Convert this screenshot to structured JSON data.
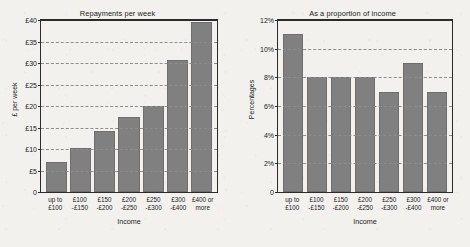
{
  "chart_data": [
    {
      "type": "bar",
      "title": "Repayments per week",
      "xlabel": "Income",
      "ylabel": "£ per week",
      "categories": [
        "up to £100",
        "£100 -£150",
        "£150 -£200",
        "£200 -£250",
        "£250 -£300",
        "£300 -£400",
        "£400 or more"
      ],
      "category_lines": [
        [
          "up to",
          "£100"
        ],
        [
          "£100",
          "-£150"
        ],
        [
          "£150",
          "-£200"
        ],
        [
          "£200",
          "-£250"
        ],
        [
          "£250",
          "-£300"
        ],
        [
          "£300",
          "-£400"
        ],
        [
          "£400 or",
          "more"
        ]
      ],
      "values": [
        6.9,
        10.3,
        14.2,
        17.5,
        20.0,
        30.8,
        39.6
      ],
      "ylim": [
        0,
        40
      ],
      "yticks": [
        0,
        5,
        10,
        15,
        20,
        25,
        30,
        35,
        40
      ],
      "ytick_labels": [
        "0",
        "£5",
        "£10",
        "£15",
        "£20",
        "£25",
        "£30",
        "£35",
        "£40"
      ],
      "grid": true,
      "legend": "none",
      "bar_color": "#808080"
    },
    {
      "type": "bar",
      "title": "As a proportion of income",
      "xlabel": "Income",
      "ylabel": "Percentages",
      "categories": [
        "up to £100",
        "£100 -£150",
        "£150 -£200",
        "£200 -£250",
        "£250 -£300",
        "£300 -£400",
        "£400 or more"
      ],
      "category_lines": [
        [
          "up to",
          "£100"
        ],
        [
          "£100",
          "-£150"
        ],
        [
          "£150",
          "-£200"
        ],
        [
          "£200",
          "-£250"
        ],
        [
          "£250",
          "-£300"
        ],
        [
          "£300",
          "-£400"
        ],
        [
          "£400 or",
          "more"
        ]
      ],
      "values": [
        11,
        8,
        8,
        8,
        7,
        9,
        7
      ],
      "ylim": [
        0,
        12
      ],
      "yticks": [
        0,
        2,
        4,
        6,
        8,
        10,
        12
      ],
      "ytick_labels": [
        "0",
        "2%",
        "4%",
        "6%",
        "8%",
        "10%",
        "12%"
      ],
      "grid": true,
      "legend": "none",
      "bar_color": "#808080"
    }
  ]
}
